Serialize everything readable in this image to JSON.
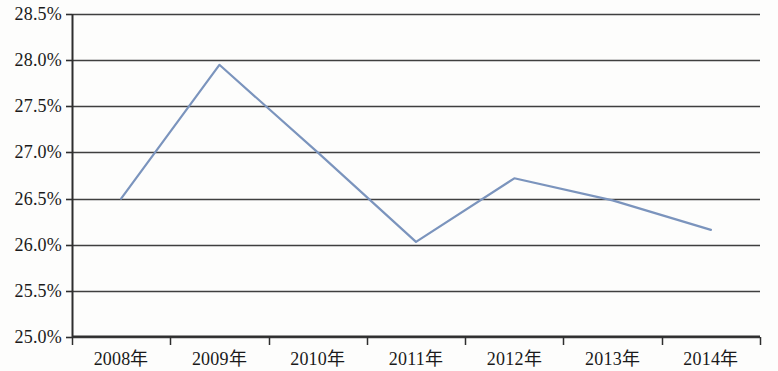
{
  "chart_data": {
    "type": "line",
    "title": "",
    "subtitle": "",
    "xlabel": "",
    "ylabel": "",
    "categories": [
      "2008年",
      "2009年",
      "2010年",
      "2011年",
      "2012年",
      "2013年",
      "2014年"
    ],
    "series": [
      {
        "name": "",
        "values": [
          26.5,
          27.95,
          27.0,
          26.03,
          26.72,
          26.48,
          26.16
        ]
      }
    ],
    "value_labels": [
      "26.50%",
      "27.95%",
      "27.00%",
      "26.03%",
      "26.72%",
      "26.48%",
      "26.16%"
    ],
    "ylim": [
      25.0,
      28.5
    ],
    "ytick_values": [
      28.5,
      28.0,
      27.5,
      27.0,
      26.5,
      26.0,
      25.5,
      25.0
    ],
    "ytick_labels": [
      "28.5%",
      "28.0%",
      "27.5%",
      "27.0%",
      "26.5%",
      "26.0%",
      "25.5%",
      "25.0%"
    ],
    "grid": true,
    "grid_axis": "y",
    "legend": false,
    "legend_position": "none",
    "markers": false,
    "colors": {
      "line": "#7b94bd",
      "grid": "#3f3f3f",
      "axis": "#2e2e2e",
      "background": "#fdfdfc",
      "text": "#1a1a1a"
    }
  },
  "axes": {
    "y_axis_name": "percent-axis",
    "x_axis_name": "year-axis"
  }
}
